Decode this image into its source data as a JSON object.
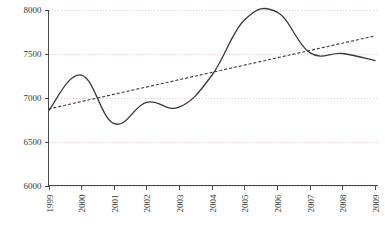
{
  "chart_data": {
    "type": "line",
    "title": "",
    "xlabel": "",
    "ylabel": "",
    "categories": [
      "1999",
      "2000",
      "2001",
      "2002",
      "2003",
      "2004",
      "2005",
      "2006",
      "2007",
      "2008",
      "2009"
    ],
    "series": [
      {
        "name": "value",
        "style": "solid-smooth",
        "values": [
          6850,
          7255,
          6705,
          6945,
          6890,
          7250,
          7880,
          7970,
          7510,
          7500,
          7420
        ]
      },
      {
        "name": "trend",
        "style": "dashed-linear",
        "values": [
          6870,
          6953,
          7036,
          7119,
          7202,
          7285,
          7368,
          7451,
          7534,
          7617,
          7700
        ]
      }
    ],
    "ylim": [
      6000,
      8000
    ],
    "ytick_values": [
      6000,
      6500,
      7000,
      7500,
      8000
    ],
    "ytick_labels": [
      "6000",
      "6500",
      "7000",
      "7500",
      "8000"
    ],
    "xtick_labels": [
      "1999",
      "2000",
      "2001",
      "2002",
      "2003",
      "2004",
      "2005",
      "2006",
      "2007",
      "2008",
      "2009"
    ],
    "xtick_rotation": -90,
    "grid": true,
    "grid_color": "#e8c8c8",
    "grid_axis": "y",
    "legend": false,
    "legend_position": "none",
    "line_color": "#3a3a3a",
    "axis_color": "#4a4a4a",
    "background": "#ffffff",
    "annotations": []
  }
}
